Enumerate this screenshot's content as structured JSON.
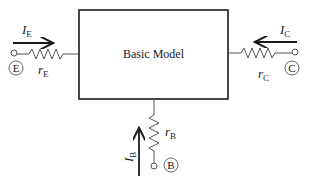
{
  "diagram": {
    "box": {
      "label": "Basic Model",
      "x": 79,
      "y": 10,
      "w": 149,
      "h": 89
    },
    "colors": {
      "stroke": "#1a1a1a",
      "wire": "#555555",
      "background": "#ffffff"
    },
    "terminals": [
      {
        "id": "emitter",
        "circle_label": "E",
        "resistor": {
          "main": "r",
          "sub": "E"
        },
        "current": {
          "main": "I",
          "sub": "E"
        },
        "arrow_direction": "right"
      },
      {
        "id": "collector",
        "circle_label": "C",
        "resistor": {
          "main": "r",
          "sub": "C"
        },
        "current": {
          "main": "I",
          "sub": "C"
        },
        "arrow_direction": "left"
      },
      {
        "id": "base",
        "circle_label": "B",
        "resistor": {
          "main": "r",
          "sub": "B"
        },
        "current": {
          "main": "I",
          "sub": "B"
        },
        "arrow_direction": "up"
      }
    ]
  }
}
